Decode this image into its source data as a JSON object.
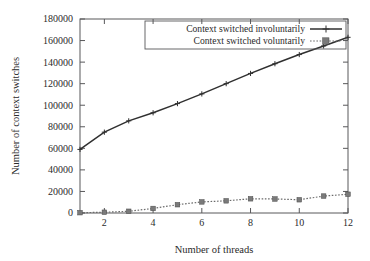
{
  "chart_data": {
    "type": "line",
    "title": "",
    "xlabel": "Number of threads",
    "ylabel": "Number of context switches",
    "xlim": [
      1,
      12
    ],
    "ylim": [
      0,
      180000
    ],
    "grid": false,
    "legend_position": "top-right-inside",
    "x": [
      1,
      2,
      3,
      4,
      5,
      6,
      7,
      8,
      9,
      10,
      11,
      12
    ],
    "xticks": [
      "2",
      "4",
      "6",
      "8",
      "10",
      "12"
    ],
    "xtick_values": [
      2,
      4,
      6,
      8,
      10,
      12
    ],
    "yticks": [
      "0",
      "20000",
      "40000",
      "60000",
      "80000",
      "100000",
      "120000",
      "140000",
      "160000",
      "180000"
    ],
    "ytick_values": [
      0,
      20000,
      40000,
      60000,
      80000,
      100000,
      120000,
      140000,
      160000,
      180000
    ],
    "series": [
      {
        "name": "Context switched involuntarily",
        "marker": "plus",
        "linestyle": "solid",
        "color": "#303030",
        "values": [
          59000,
          75000,
          85500,
          93000,
          101500,
          110500,
          120000,
          129500,
          138500,
          147000,
          155000,
          163000
        ]
      },
      {
        "name": "Context switched voluntarily",
        "marker": "square",
        "linestyle": "dotted",
        "color": "#6b6b6b",
        "values": [
          300,
          700,
          1600,
          4200,
          7700,
          10300,
          11300,
          13200,
          13000,
          12300,
          15700,
          17400
        ]
      }
    ]
  },
  "legend": {
    "entries": [
      {
        "label": "Context switched involuntarily"
      },
      {
        "label": "Context switched voluntarily"
      }
    ]
  },
  "colors": {
    "axis": "#58585a",
    "text": "#2b2b2b",
    "involuntary": "#303030",
    "voluntary": "#6b6b6b",
    "background": "#ffffff"
  }
}
